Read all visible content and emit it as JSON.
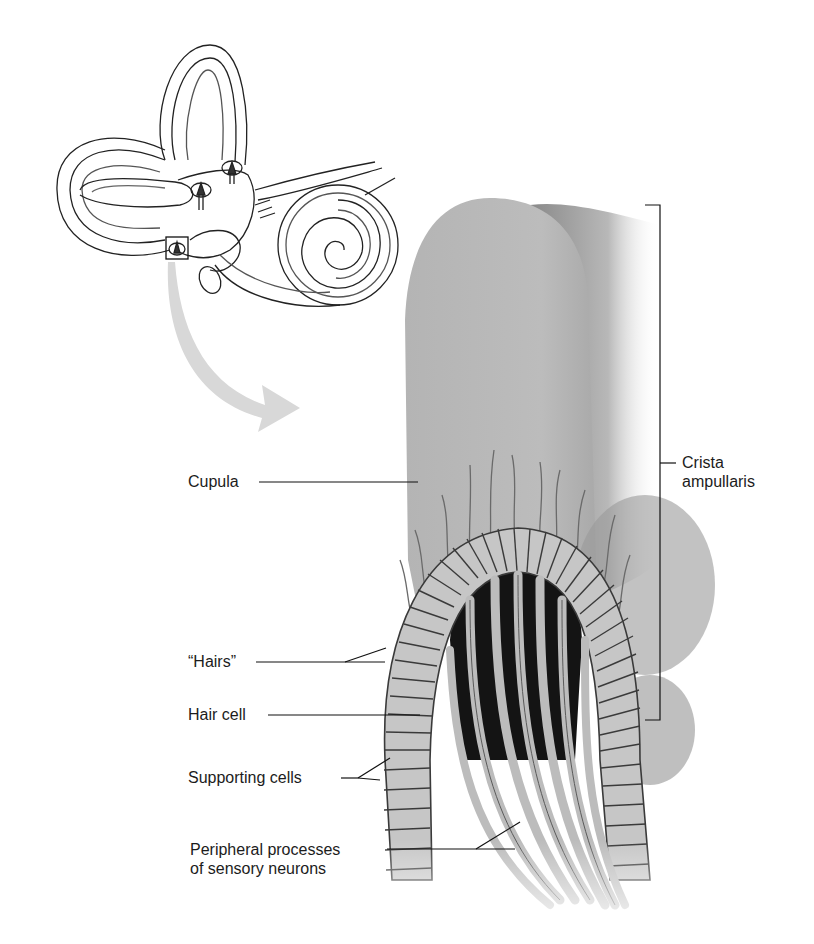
{
  "figure": {
    "inset": {
      "name": "inner-ear-labyrinth",
      "highlight": "ampulla box"
    },
    "labels": {
      "cupula": "Cupula",
      "hairs": "“Hairs”",
      "hair_cell": "Hair cell",
      "supporting_cells": "Supporting cells",
      "peripheral_line1": "Peripheral processes",
      "peripheral_line2": "of sensory neurons",
      "crista_line1": "Crista",
      "crista_line2": "ampullaris"
    },
    "colors": {
      "background": "#ffffff",
      "cupula_fill": "#b9b9b9",
      "cupula_shadow": "#8a8a8a",
      "cell_fill": "#c8c8c8",
      "cell_outline": "#3a3a3a",
      "core_dark": "#111111",
      "neuron_fill": "#bdbdbd",
      "arrow_fill": "#d6d6d6",
      "line": "#111111"
    }
  }
}
